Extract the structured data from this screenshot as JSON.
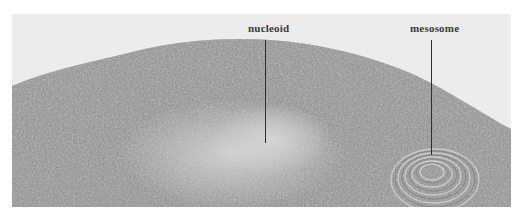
{
  "figure": {
    "type": "electron-micrograph",
    "labels": [
      {
        "text": "nucleoid",
        "x": 265,
        "y": 25,
        "line_top": 40,
        "line_bottom": 143
      },
      {
        "text": "mesosome",
        "x": 431,
        "y": 25,
        "line_top": 40,
        "line_bottom": 155
      }
    ],
    "colors": {
      "background": "#ececec",
      "cytoplasm": "#8a8a8a",
      "label": "#3a3a3a"
    }
  }
}
